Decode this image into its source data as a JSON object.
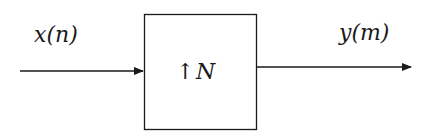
{
  "diagram": {
    "type": "block-diagram",
    "input": {
      "label": "x(n)"
    },
    "block": {
      "symbol": "↑",
      "factor": "N",
      "label": "↑ N"
    },
    "output": {
      "label": "y(m)"
    },
    "colors": {
      "stroke": "#1a1a1a",
      "background": "#ffffff"
    }
  }
}
